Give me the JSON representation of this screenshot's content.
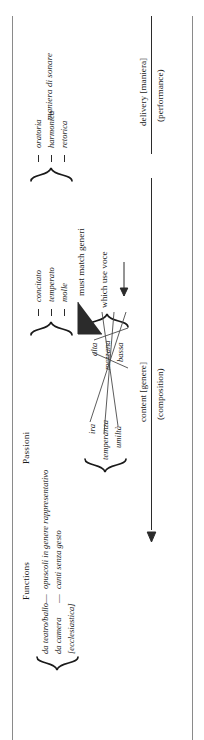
{
  "diagram": {
    "title_functions": "Functions",
    "title_passioni": "Passioni",
    "functions": {
      "rows": [
        {
          "left": "da teatro/ballo",
          "sep": "—",
          "right": "opuscoli in genere rappresentativo"
        },
        {
          "left": "da camera",
          "sep": "—",
          "right": "canti senza gesto"
        },
        {
          "left": "[ecclesiastica]",
          "sep": "",
          "right": ""
        }
      ]
    },
    "affetti": {
      "items": [
        "ira",
        "temperanza",
        "umiltà"
      ]
    },
    "voce": {
      "items": [
        "alta",
        "mezzana",
        "bassa"
      ],
      "caption": "which use voce"
    },
    "generi": {
      "items": [
        "concitato",
        "temperato",
        "molle"
      ],
      "caption": "must match generi"
    },
    "maniera": {
      "items": [
        "oratoria",
        "harmonica",
        "retorica"
      ],
      "label": "maniera di sonare"
    },
    "axes": {
      "content": "content [genere]",
      "content_sub": "(composition)",
      "delivery": "delivery [maniera]",
      "delivery_sub": "(performance)"
    },
    "colors": {
      "ink": "#1a1a1a",
      "rule": "#2b2b2b",
      "frame": "#8a8a8a",
      "connector": "#4a4a4a"
    }
  }
}
